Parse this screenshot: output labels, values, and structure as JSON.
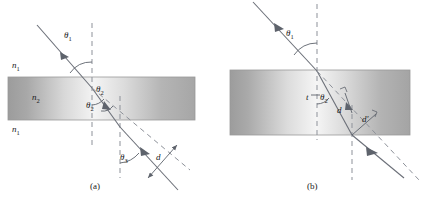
{
  "figure": {
    "panels": [
      {
        "id": "a",
        "caption": "(a)",
        "media_labels": [
          {
            "name": "n1-top",
            "base": "n",
            "sub": "1"
          },
          {
            "name": "n2-slab",
            "base": "n",
            "sub": "2"
          },
          {
            "name": "n1-bottom",
            "base": "n",
            "sub": "1"
          }
        ],
        "angles": [
          {
            "name": "theta1",
            "base": "θ",
            "sub": "1"
          },
          {
            "name": "theta2-upper",
            "base": "θ",
            "sub": "2"
          },
          {
            "name": "theta2-lower",
            "base": "θ",
            "sub": "2"
          },
          {
            "name": "theta3",
            "base": "θ",
            "sub": "3"
          }
        ],
        "distances": [
          {
            "name": "d-offset",
            "base": "d",
            "sub": ""
          }
        ]
      },
      {
        "id": "b",
        "caption": "(b)",
        "media_labels": [],
        "angles": [
          {
            "name": "theta1",
            "base": "θ",
            "sub": "1"
          },
          {
            "name": "theta2",
            "base": "θ",
            "sub": "2"
          }
        ],
        "distances": [
          {
            "name": "t-thickness",
            "base": "t",
            "sub": ""
          },
          {
            "name": "d-offset",
            "base": "d",
            "sub": ""
          },
          {
            "name": "d-prime",
            "base": "d′",
            "sub": ""
          }
        ]
      }
    ],
    "colors": {
      "background": "#ffffff",
      "ray": "#6b6f78",
      "dashed": "#8d9199",
      "slab_edge": "#9a9a9a",
      "slab_dark": "#9d9d9d",
      "slab_light": "#f2f2f2",
      "text": "#1a1a1a"
    },
    "geometry": {
      "panel_a": {
        "slab_x0": 8,
        "slab_x1": 195,
        "slab_y0": 77,
        "slab_y1": 120,
        "normal_x": 92
      },
      "panel_b": {
        "slab_x0": 230,
        "slab_x1": 410,
        "slab_y0": 70,
        "slab_y1": 135,
        "normal_x": 317
      }
    }
  }
}
